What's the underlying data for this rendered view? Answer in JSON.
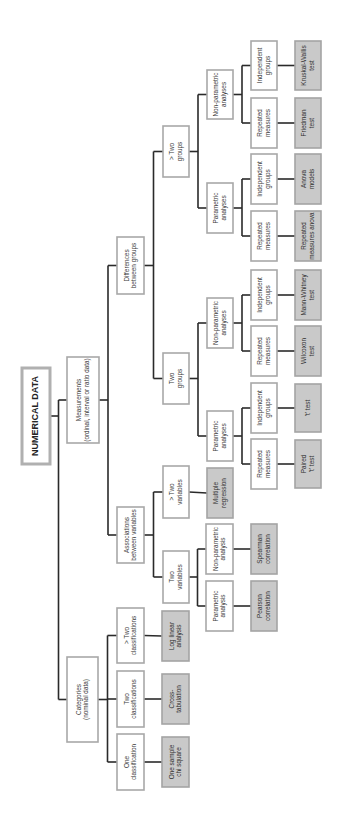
{
  "diagram": {
    "title": "NUMERICAL DATA",
    "nodes": {
      "root": [
        "NUMERICAL DATA"
      ],
      "measurements": [
        "Measurements",
        "(ordinal, interval or ratio data)"
      ],
      "categories": [
        "Categories",
        "(nominal data)"
      ],
      "differences": [
        "Differences",
        "between groups"
      ],
      "associations": [
        "Associations",
        "between variables"
      ],
      "gt_two_groups": [
        "> Two",
        "groups"
      ],
      "two_groups": [
        "Two",
        "groups"
      ],
      "gt_two_variables": [
        "> Two",
        "variables"
      ],
      "two_variables": [
        "Two",
        "variables"
      ],
      "gt_two_classifications": [
        "> Two",
        "classifications"
      ],
      "two_classifications": [
        "Two",
        "classifications"
      ],
      "one_classification": [
        "One",
        "classification"
      ],
      "gtg_nonparam": [
        "Non-parametric",
        "analyses"
      ],
      "gtg_param": [
        "Parametric",
        "analyses"
      ],
      "tg_nonparam": [
        "Non-parametric",
        "analyses"
      ],
      "tg_param": [
        "Parametric",
        "analyses"
      ],
      "tv_nonparam": [
        "Non-parametric",
        "analysis"
      ],
      "tv_param": [
        "Parametric",
        "analysis"
      ],
      "gtg_np_indep": [
        "Independent",
        "groups"
      ],
      "gtg_np_rep": [
        "Repeated",
        "measures"
      ],
      "gtg_p_indep": [
        "Independent",
        "groups"
      ],
      "gtg_p_rep": [
        "Repeated",
        "measures"
      ],
      "tg_np_indep": [
        "Independent",
        "groups"
      ],
      "tg_np_rep": [
        "Repeated",
        "measures"
      ],
      "tg_p_indep": [
        "Independent",
        "groups"
      ],
      "tg_p_rep": [
        "Repeated",
        "measures"
      ],
      "kruskal": [
        "Kruskal-Wallis",
        "test"
      ],
      "friedman": [
        "Friedman",
        "test"
      ],
      "anova": [
        "Anova",
        "models"
      ],
      "rm_anova": [
        "Repeated",
        "measures anova"
      ],
      "mann_whitney": [
        "Mann-Whitney",
        "test"
      ],
      "wilcoxon": [
        "Wilcoxon",
        "test"
      ],
      "t_test": [
        "'t' test"
      ],
      "paired_t": [
        "Paired",
        "'t' test"
      ],
      "multiple_regression": [
        "Multiple",
        "regression"
      ],
      "spearman": [
        "Spearman",
        "correlation"
      ],
      "pearson": [
        "Pearson",
        "correlation"
      ],
      "log_linear": [
        "Log linear",
        "analysis"
      ],
      "cross_tab": [
        "Cross-",
        "tabulation"
      ],
      "chi_square": [
        "One sample",
        "chi square"
      ]
    },
    "edges": [
      [
        "root",
        "measurements"
      ],
      [
        "root",
        "categories"
      ],
      [
        "measurements",
        "differences"
      ],
      [
        "measurements",
        "associations"
      ],
      [
        "differences",
        "gt_two_groups"
      ],
      [
        "differences",
        "two_groups"
      ],
      [
        "gt_two_groups",
        "gtg_nonparam"
      ],
      [
        "gt_two_groups",
        "gtg_param"
      ],
      [
        "gtg_nonparam",
        "gtg_np_indep"
      ],
      [
        "gtg_nonparam",
        "gtg_np_rep"
      ],
      [
        "gtg_param",
        "gtg_p_indep"
      ],
      [
        "gtg_param",
        "gtg_p_rep"
      ],
      [
        "gtg_np_indep",
        "kruskal"
      ],
      [
        "gtg_np_rep",
        "friedman"
      ],
      [
        "gtg_p_indep",
        "anova"
      ],
      [
        "gtg_p_rep",
        "rm_anova"
      ],
      [
        "two_groups",
        "tg_nonparam"
      ],
      [
        "two_groups",
        "tg_param"
      ],
      [
        "tg_nonparam",
        "tg_np_indep"
      ],
      [
        "tg_nonparam",
        "tg_np_rep"
      ],
      [
        "tg_param",
        "tg_p_indep"
      ],
      [
        "tg_param",
        "tg_p_rep"
      ],
      [
        "tg_np_indep",
        "mann_whitney"
      ],
      [
        "tg_np_rep",
        "wilcoxon"
      ],
      [
        "tg_p_indep",
        "t_test"
      ],
      [
        "tg_p_rep",
        "paired_t"
      ],
      [
        "associations",
        "gt_two_variables"
      ],
      [
        "associations",
        "two_variables"
      ],
      [
        "gt_two_variables",
        "multiple_regression"
      ],
      [
        "two_variables",
        "tv_nonparam"
      ],
      [
        "two_variables",
        "tv_param"
      ],
      [
        "tv_nonparam",
        "spearman"
      ],
      [
        "tv_param",
        "pearson"
      ],
      [
        "categories",
        "gt_two_classifications"
      ],
      [
        "categories",
        "two_classifications"
      ],
      [
        "categories",
        "one_classification"
      ],
      [
        "gt_two_classifications",
        "log_linear"
      ],
      [
        "two_classifications",
        "cross_tab"
      ],
      [
        "one_classification",
        "chi_square"
      ]
    ],
    "leaf_nodes": [
      "kruskal",
      "friedman",
      "anova",
      "rm_anova",
      "mann_whitney",
      "wilcoxon",
      "t_test",
      "paired_t",
      "multiple_regression",
      "spearman",
      "pearson",
      "log_linear",
      "cross_tab",
      "chi_square"
    ]
  }
}
